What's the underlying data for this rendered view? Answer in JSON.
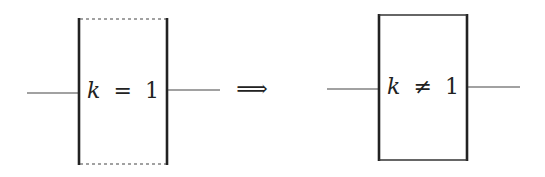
{
  "diagram": {
    "colors": {
      "stroke": "#222222",
      "wire": "#444444",
      "background": "#ffffff"
    },
    "left_block": {
      "variable": "k",
      "relation": "=",
      "value": "1",
      "border_style_top_bottom": "dashed",
      "border_style_sides": "solid"
    },
    "arrow": {
      "symbol": "⟹",
      "meaning": "implies / transforms to"
    },
    "right_block": {
      "variable": "k",
      "relation": "≠",
      "value": "1",
      "border_style_top_bottom": "solid",
      "border_style_sides": "solid"
    }
  }
}
